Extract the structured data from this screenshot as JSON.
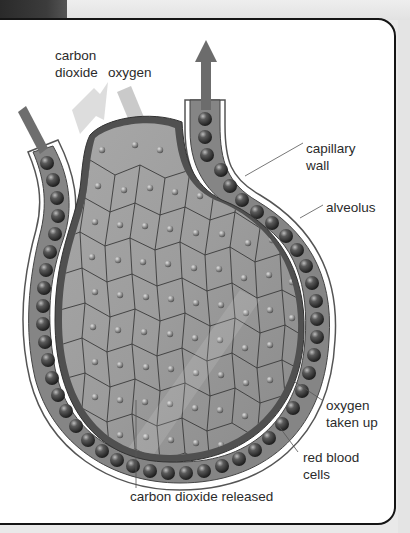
{
  "figure": {
    "colors": {
      "background": "#ffffff",
      "frame_border": "#151515",
      "alveolus_fill": "#9a9a9a",
      "alveolus_wall": "#555555",
      "capillary_fill": "#7a7a7a",
      "red_blood_cell": "#3a3a3a",
      "arrow_dark": "#666666",
      "arrow_light": "#d0d0d0",
      "label_text": "#2b2b2b"
    }
  },
  "labels": {
    "carbon_dioxide_line1": "carbon",
    "carbon_dioxide_line2": "dioxide",
    "oxygen_top": "oxygen",
    "capillary_wall_line1": "capillary",
    "capillary_wall_line2": "wall",
    "alveolus": "alveolus",
    "oxygen_taken_up_line1": "oxygen",
    "oxygen_taken_up_line2": "taken up",
    "red_blood_cells_line1": "red blood",
    "red_blood_cells_line2": "cells",
    "carbon_dioxide_released": "carbon dioxide released"
  }
}
